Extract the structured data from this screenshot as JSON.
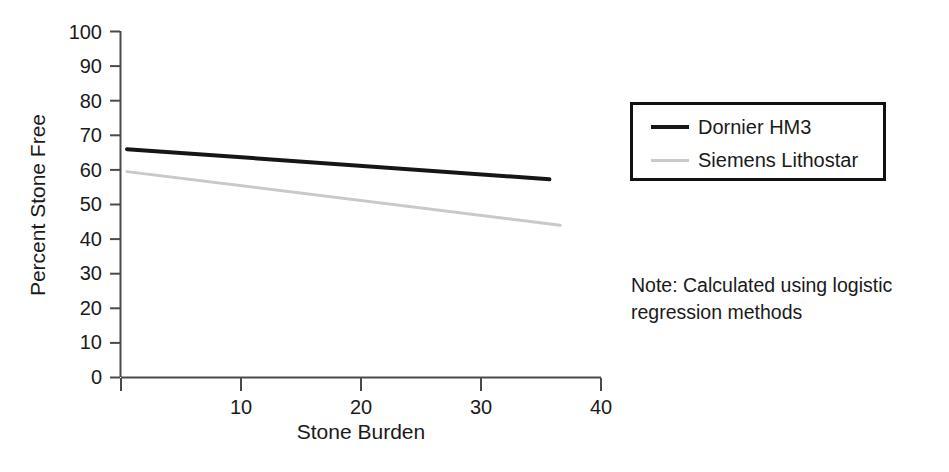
{
  "figure": {
    "background_color": "#ffffff",
    "note_lines": [
      "Note: Calculated using logistic",
      "regression methods"
    ]
  },
  "axes": {
    "y_title": "Percent Stone Free",
    "x_title": "Stone Burden",
    "y_ticks": [
      "0",
      "10",
      "20",
      "30",
      "40",
      "50",
      "60",
      "70",
      "80",
      "90",
      "100"
    ],
    "x_ticks": [
      "10",
      "20",
      "30",
      "40"
    ]
  },
  "legend": {
    "entries": [
      {
        "label": "Dornier HM3",
        "color": "#161616",
        "style": "solid-dark"
      },
      {
        "label": "Siemens Lithostar",
        "color": "#c9c9c9",
        "style": "solid-light"
      }
    ]
  },
  "chart_data": {
    "type": "line",
    "title": "",
    "xlabel": "Stone Burden",
    "ylabel": "Percent Stone Free",
    "xlim": [
      0,
      40
    ],
    "ylim": [
      0,
      100
    ],
    "xticks": [
      0,
      10,
      20,
      30,
      40
    ],
    "yticks": [
      0,
      10,
      20,
      30,
      40,
      50,
      60,
      70,
      80,
      90,
      100
    ],
    "grid": false,
    "legend_position": "right-top",
    "annotation": "Note: Calculated using logistic regression methods",
    "series": [
      {
        "name": "Dornier HM3",
        "color": "#161616",
        "linewidth": 4,
        "x": [
          0.5,
          35.7
        ],
        "y": [
          66.0,
          57.3
        ]
      },
      {
        "name": "Siemens Lithostar",
        "color": "#c9c9c9",
        "linewidth": 3,
        "x": [
          0.5,
          36.6
        ],
        "y": [
          59.5,
          44.0
        ]
      }
    ]
  }
}
